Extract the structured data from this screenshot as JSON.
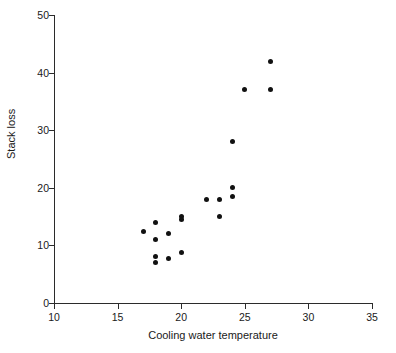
{
  "chart_data": {
    "type": "scatter",
    "title": "",
    "xlabel": "Cooling water temperature",
    "ylabel": "Stack loss",
    "xlim": [
      10,
      35
    ],
    "ylim": [
      0,
      50
    ],
    "xticks": [
      10,
      15,
      20,
      25,
      30,
      35
    ],
    "yticks": [
      0,
      10,
      20,
      30,
      40,
      50
    ],
    "grid": false,
    "legend": false,
    "marker": "filled-circle",
    "marker_color": "#111111",
    "axis_color": "#2b2b2b",
    "background_color": "#ffffff",
    "points": [
      {
        "x": 27,
        "y": 42
      },
      {
        "x": 25,
        "y": 37
      },
      {
        "x": 27,
        "y": 37
      },
      {
        "x": 24,
        "y": 28
      },
      {
        "x": 24,
        "y": 20
      },
      {
        "x": 24,
        "y": 18.5
      },
      {
        "x": 22,
        "y": 18
      },
      {
        "x": 23,
        "y": 18
      },
      {
        "x": 20,
        "y": 15
      },
      {
        "x": 23,
        "y": 15
      },
      {
        "x": 20,
        "y": 14.5
      },
      {
        "x": 18,
        "y": 14
      },
      {
        "x": 17,
        "y": 12.5
      },
      {
        "x": 19,
        "y": 12
      },
      {
        "x": 18,
        "y": 11
      },
      {
        "x": 20,
        "y": 8.7
      },
      {
        "x": 18,
        "y": 8
      },
      {
        "x": 19,
        "y": 7.8
      },
      {
        "x": 18,
        "y": 7
      }
    ]
  }
}
